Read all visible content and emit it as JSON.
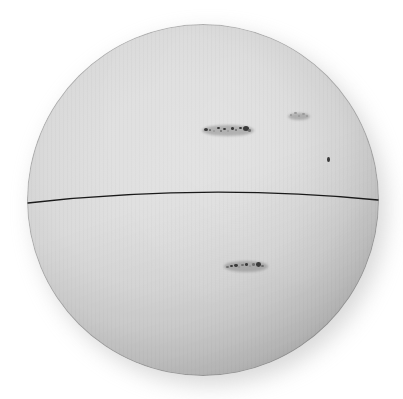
{
  "image": {
    "title": "Photograph of the solar disk",
    "subject": "sun-photosphere",
    "medium": "halftone print",
    "background_color": "#ffffff"
  },
  "disk": {
    "label": "solar-disk",
    "center_x": 203,
    "center_y": 200,
    "radius": 176,
    "limb_color": "#8e8e8e",
    "center_color": "#f6f6f6",
    "shadow_color": "#b9b9b9"
  },
  "equator_line": {
    "label": "equator-reference-line",
    "color": "#1a1a1a",
    "stroke_width": 1.3,
    "x_start": 28,
    "y_start": 203,
    "x_mid": 205,
    "y_mid": 189,
    "x_end": 378,
    "y_end": 200
  },
  "sunspot_groups": [
    {
      "id": "northern-group",
      "label": "sunspot-group-north",
      "center_x": 228,
      "center_y": 130,
      "extent_x": 48,
      "extent_y": 12,
      "spots": [
        {
          "x": 0,
          "y": 4,
          "w": 4.0,
          "h": 3.0,
          "tone": "dark"
        },
        {
          "x": 5,
          "y": 5,
          "w": 2.4,
          "h": 2.0,
          "tone": "soft"
        },
        {
          "x": 9,
          "y": 6,
          "w": 2.0,
          "h": 1.8,
          "tone": "faint"
        },
        {
          "x": 13,
          "y": 3,
          "w": 2.6,
          "h": 2.2,
          "tone": "dark"
        },
        {
          "x": 16,
          "y": 6,
          "w": 2.0,
          "h": 2.0,
          "tone": "soft"
        },
        {
          "x": 19,
          "y": 4,
          "w": 3.0,
          "h": 2.4,
          "tone": "dark"
        },
        {
          "x": 23,
          "y": 6,
          "w": 2.2,
          "h": 2.0,
          "tone": "faint"
        },
        {
          "x": 27,
          "y": 3,
          "w": 3.2,
          "h": 2.6,
          "tone": "dark"
        },
        {
          "x": 31,
          "y": 5,
          "w": 2.4,
          "h": 2.2,
          "tone": "soft"
        },
        {
          "x": 35,
          "y": 3,
          "w": 3.0,
          "h": 2.4,
          "tone": "dark"
        },
        {
          "x": 39,
          "y": 2,
          "w": 6.0,
          "h": 5.0,
          "tone": "dark"
        },
        {
          "x": 44,
          "y": 5,
          "w": 3.0,
          "h": 2.6,
          "tone": "soft"
        }
      ]
    },
    {
      "id": "southern-group",
      "label": "sunspot-group-south",
      "center_x": 246,
      "center_y": 266,
      "extent_x": 40,
      "extent_y": 12,
      "spots": [
        {
          "x": 0,
          "y": 6,
          "w": 3.2,
          "h": 2.4,
          "tone": "soft"
        },
        {
          "x": 4,
          "y": 5,
          "w": 2.6,
          "h": 2.2,
          "tone": "dark"
        },
        {
          "x": 8,
          "y": 4,
          "w": 3.6,
          "h": 2.8,
          "tone": "dark"
        },
        {
          "x": 12,
          "y": 6,
          "w": 2.2,
          "h": 2.0,
          "tone": "faint"
        },
        {
          "x": 15,
          "y": 4,
          "w": 2.8,
          "h": 2.4,
          "tone": "soft"
        },
        {
          "x": 19,
          "y": 3,
          "w": 3.4,
          "h": 2.8,
          "tone": "dark"
        },
        {
          "x": 23,
          "y": 5,
          "w": 2.4,
          "h": 2.0,
          "tone": "faint"
        },
        {
          "x": 26,
          "y": 3,
          "w": 3.0,
          "h": 2.6,
          "tone": "soft"
        },
        {
          "x": 30,
          "y": 2,
          "w": 5.4,
          "h": 4.6,
          "tone": "dark"
        },
        {
          "x": 35,
          "y": 5,
          "w": 2.6,
          "h": 2.2,
          "tone": "soft"
        }
      ]
    },
    {
      "id": "isolated-spot-east",
      "label": "sunspot-isolated",
      "center_x": 329,
      "center_y": 160,
      "extent_x": 4,
      "extent_y": 6,
      "spots": [
        {
          "x": 0,
          "y": 0,
          "w": 3.2,
          "h": 5.0,
          "tone": "dark"
        }
      ]
    },
    {
      "id": "faint-plage-north-east",
      "label": "sunspot-faint-cluster",
      "center_x": 299,
      "center_y": 116,
      "extent_x": 18,
      "extent_y": 8,
      "spots": [
        {
          "x": 0,
          "y": 2,
          "w": 2.4,
          "h": 2.0,
          "tone": "faint"
        },
        {
          "x": 4,
          "y": 0,
          "w": 2.6,
          "h": 2.2,
          "tone": "faint"
        },
        {
          "x": 8,
          "y": 3,
          "w": 2.2,
          "h": 1.8,
          "tone": "faint"
        },
        {
          "x": 12,
          "y": 1,
          "w": 2.8,
          "h": 2.2,
          "tone": "faint"
        },
        {
          "x": 16,
          "y": 3,
          "w": 2.0,
          "h": 1.8,
          "tone": "faint"
        }
      ]
    }
  ],
  "chart_data": {
    "type": "scatter",
    "xlabel": "",
    "ylabel": "",
    "xlim": [
      27,
      379
    ],
    "ylim": [
      22,
      379
    ],
    "grid": false,
    "legend": "none",
    "annotations": [
      "solar disk with limb darkening",
      "thin dark reference line crossing the disk near the equator",
      "two prominent sunspot groups (northern and southern hemispheres)",
      "one small isolated sunspot toward the east limb"
    ],
    "series": [
      {
        "name": "sunspot groups",
        "points": [
          {
            "x": 228,
            "y": 130,
            "label": "northern group"
          },
          {
            "x": 246,
            "y": 266,
            "label": "southern group"
          },
          {
            "x": 329,
            "y": 160,
            "label": "isolated spot"
          },
          {
            "x": 299,
            "y": 116,
            "label": "faint cluster"
          }
        ]
      }
    ]
  }
}
